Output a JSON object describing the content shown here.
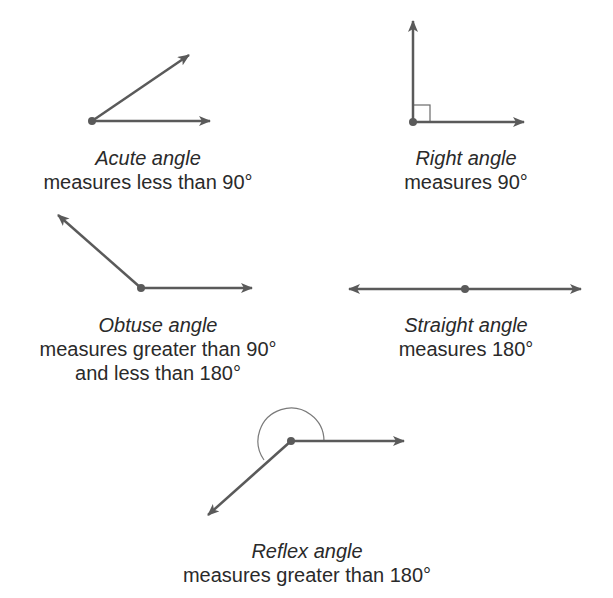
{
  "diagram": {
    "stroke_color": "#5a5a5a",
    "arc_color": "#7a7a7a",
    "angles": [
      {
        "id": "acute",
        "name": "Acute angle",
        "description": [
          "measures less than 90°"
        ]
      },
      {
        "id": "right",
        "name": "Right angle",
        "description": [
          "measures 90°"
        ]
      },
      {
        "id": "obtuse",
        "name": "Obtuse angle",
        "description": [
          "measures greater than 90°",
          "and less than 180°"
        ]
      },
      {
        "id": "straight",
        "name": "Straight angle",
        "description": [
          "measures 180°"
        ]
      },
      {
        "id": "reflex",
        "name": "Reflex angle",
        "description": [
          "measures greater than 180°"
        ]
      }
    ]
  }
}
